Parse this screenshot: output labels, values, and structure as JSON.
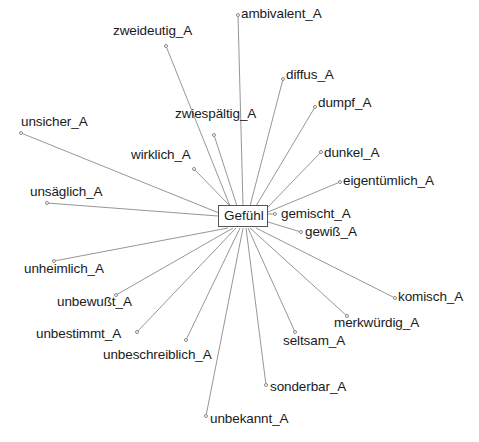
{
  "graph": {
    "type": "radial-semantic-network",
    "center": {
      "label": "Gefühl",
      "x": 218,
      "y": 205,
      "width": 50,
      "height": 22
    },
    "style": {
      "edge_color": "#8a8a8a",
      "node_marker_color": "#8a8a8a",
      "text_color": "#1a1a1a",
      "background": "#ffffff"
    },
    "nodes": [
      {
        "label": "ambivalent_A",
        "dot_x": 236,
        "dot_y": 13,
        "text_x": 241,
        "text_y": 7,
        "edge_x": 243,
        "edge_y": 206
      },
      {
        "label": "zweideutig_A",
        "dot_x": 164,
        "dot_y": 44,
        "text_x": 113,
        "text_y": 24,
        "edge_x": 230,
        "edge_y": 206
      },
      {
        "label": "diffus_A",
        "dot_x": 281,
        "dot_y": 77,
        "text_x": 286,
        "text_y": 68,
        "edge_x": 250,
        "edge_y": 206
      },
      {
        "label": "dumpf_A",
        "dot_x": 313,
        "dot_y": 105,
        "text_x": 318,
        "text_y": 96,
        "edge_x": 256,
        "edge_y": 206
      },
      {
        "label": "zwiespältig_A",
        "dot_x": 212,
        "dot_y": 133,
        "text_x": 175,
        "text_y": 107,
        "edge_x": 237,
        "edge_y": 206
      },
      {
        "label": "unsicher_A",
        "dot_x": 19,
        "dot_y": 131,
        "text_x": 21,
        "text_y": 115,
        "edge_x": 219,
        "edge_y": 213
      },
      {
        "label": "dunkel_A",
        "dot_x": 319,
        "dot_y": 150,
        "text_x": 324,
        "text_y": 146,
        "edge_x": 266,
        "edge_y": 209
      },
      {
        "label": "wirklich_A",
        "dot_x": 192,
        "dot_y": 167,
        "text_x": 131,
        "text_y": 148,
        "edge_x": 230,
        "edge_y": 206
      },
      {
        "label": "eigentümlich_A",
        "dot_x": 338,
        "dot_y": 180,
        "text_x": 343,
        "text_y": 174,
        "edge_x": 268,
        "edge_y": 212
      },
      {
        "label": "unsäglich_A",
        "dot_x": 45,
        "dot_y": 201,
        "text_x": 30,
        "text_y": 185,
        "edge_x": 218,
        "edge_y": 216
      },
      {
        "label": "gemischt_A",
        "dot_x": 273,
        "dot_y": 212,
        "text_x": 281,
        "text_y": 207,
        "edge_x": 268,
        "edge_y": 214
      },
      {
        "label": "gewiß_A",
        "dot_x": 299,
        "dot_y": 230,
        "text_x": 305,
        "text_y": 225,
        "edge_x": 268,
        "edge_y": 222
      },
      {
        "label": "unheimlich_A",
        "dot_x": 52,
        "dot_y": 259,
        "text_x": 24,
        "text_y": 262,
        "edge_x": 228,
        "edge_y": 228
      },
      {
        "label": "unbewußt_A",
        "dot_x": 114,
        "dot_y": 293,
        "text_x": 57,
        "text_y": 295,
        "edge_x": 233,
        "edge_y": 228
      },
      {
        "label": "komisch_A",
        "dot_x": 393,
        "dot_y": 296,
        "text_x": 398,
        "text_y": 290,
        "edge_x": 256,
        "edge_y": 228
      },
      {
        "label": "unbestimmt_A",
        "dot_x": 135,
        "dot_y": 330,
        "text_x": 36,
        "text_y": 327,
        "edge_x": 236,
        "edge_y": 228
      },
      {
        "label": "merkwürdig_A",
        "dot_x": 345,
        "dot_y": 314,
        "text_x": 334,
        "text_y": 316,
        "edge_x": 250,
        "edge_y": 228
      },
      {
        "label": "seltsam_A",
        "dot_x": 293,
        "dot_y": 330,
        "text_x": 283,
        "text_y": 334,
        "edge_x": 248,
        "edge_y": 228
      },
      {
        "label": "unbeschreiblich_A",
        "dot_x": 184,
        "dot_y": 338,
        "text_x": 103,
        "text_y": 348,
        "edge_x": 240,
        "edge_y": 228
      },
      {
        "label": "sonderbar_A",
        "dot_x": 264,
        "dot_y": 383,
        "text_x": 270,
        "text_y": 380,
        "edge_x": 246,
        "edge_y": 228
      },
      {
        "label": "unbekannt_A",
        "dot_x": 204,
        "dot_y": 414,
        "text_x": 210,
        "text_y": 412,
        "edge_x": 243,
        "edge_y": 228
      }
    ]
  }
}
